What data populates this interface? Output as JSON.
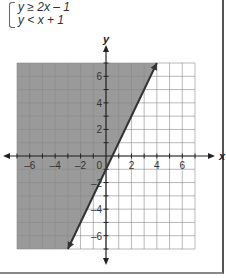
{
  "system": {
    "inequalities": [
      "y ≥ 2x – 1",
      "y < x + 1"
    ]
  },
  "chart_data": {
    "type": "line",
    "title": "",
    "xlabel": "x",
    "ylabel": "y",
    "xlim": [
      -7,
      7
    ],
    "ylim": [
      -7,
      7
    ],
    "grid": true,
    "x_ticks": [
      "-6",
      "-4",
      "-2",
      "2",
      "4",
      "6"
    ],
    "y_ticks": [
      "6",
      "4",
      "2",
      "-2",
      "-4",
      "-6"
    ],
    "origin_label": "0",
    "series": [
      {
        "name": "y = 2x - 1",
        "style": "solid",
        "points": [
          [
            -3,
            -7
          ],
          [
            4,
            7
          ]
        ],
        "shading": "above-left (y ≥ 2x - 1)"
      }
    ],
    "shade_color": "#9a9a9a"
  }
}
